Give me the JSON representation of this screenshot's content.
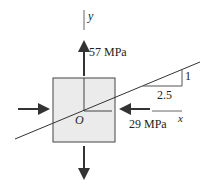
{
  "diagram": {
    "type": "stress element",
    "axes": {
      "x_label": "x",
      "y_label": "y",
      "origin_label": "O"
    },
    "stresses": {
      "vertical": {
        "label": "57 MPa",
        "direction": "tension"
      },
      "horizontal": {
        "label": "29 MPa",
        "direction": "compression"
      }
    },
    "slope": {
      "rise": "1",
      "run": "2.5"
    },
    "colors": {
      "element_fill": "#ebebeb",
      "stroke": "#333333"
    }
  }
}
